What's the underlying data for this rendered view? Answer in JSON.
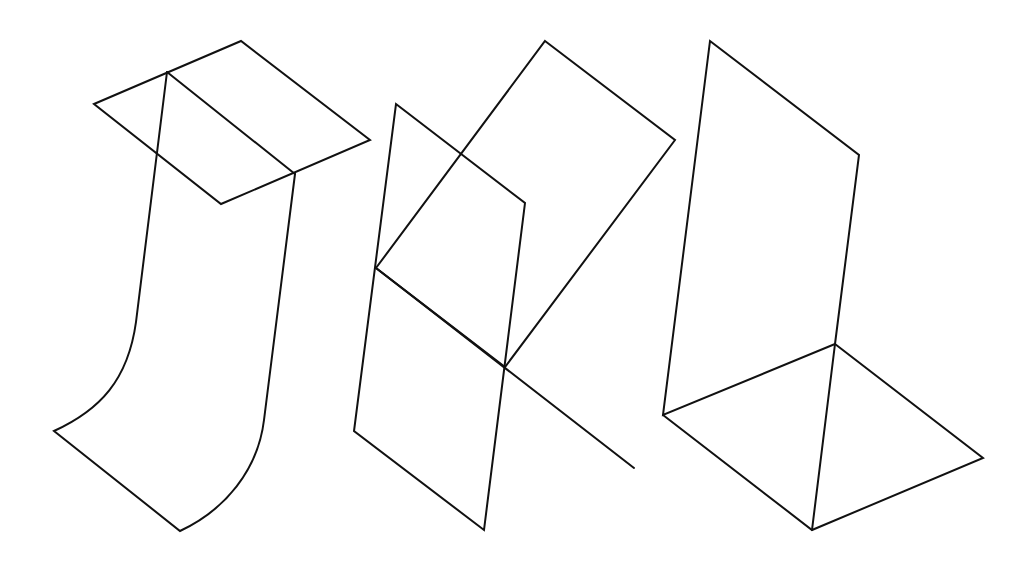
{
  "figure": {
    "background": "#ffffff",
    "stroke_color": "#111111",
    "stroke_width": 2,
    "figures": [
      {
        "name": "curved-sheet-with-square",
        "description": "A horizontal parallelogram plane pierced by a curved vertical sheet",
        "paths": [
          "M94,104 L241,41 L370,140 L221,204 Z",
          "M167,72 L295,174",
          "M167,72 L136,322 C128,380 100,410 54,431 L180,531 C225,510 258,470 264,420 L295,174"
        ]
      },
      {
        "name": "two-intersecting-planes",
        "description": "Two intersecting planar parallelograms with an extended intersection line",
        "paths": [
          "M396,104 L525,203 L484,530 L354,431 Z",
          "M545,41 L675,140 L505,367 L376,268 Z",
          "M376,268 L634,468"
        ]
      },
      {
        "name": "l-shaped-planes",
        "description": "A vertical plane joined to a horizontal plane forming an L shape",
        "paths": [
          "M710,41 L859,155 L835,344 L663,415 Z",
          "M663,415 L812,530 L983,458 L835,344",
          "M835,344 L812,530"
        ]
      }
    ]
  }
}
